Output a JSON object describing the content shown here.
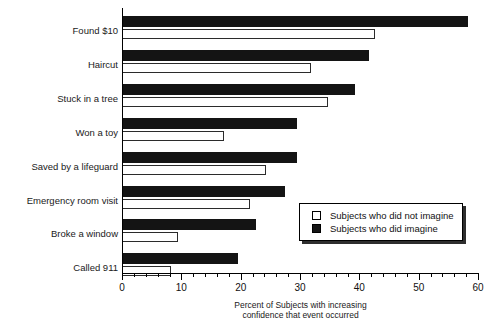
{
  "chart_data": {
    "type": "bar",
    "orientation": "horizontal",
    "title": "",
    "xlabel": "Percent of Subjects with increasing confidence that event occurred",
    "xlabel_line1": "Percent of Subjects with increasing",
    "xlabel_line2": "confidence that event occurred",
    "ylabel": "",
    "xlim": [
      0,
      60
    ],
    "xticks": [
      0,
      10,
      20,
      30,
      40,
      50,
      60
    ],
    "xtick_labels": [
      "0",
      "10",
      "20",
      "30",
      "40",
      "50",
      "60"
    ],
    "minor_tick_step": 2,
    "grid": false,
    "categories": [
      "Found $10",
      "Haircut",
      "Stuck in a tree",
      "Won a toy",
      "Saved by a lifeguard",
      "Emergency room visit",
      "Broke a window",
      "Called 911"
    ],
    "series": [
      {
        "name": "Subjects who did imagine",
        "color": "#141414",
        "values": [
          58.3,
          41.6,
          39.3,
          29.5,
          29.5,
          27.5,
          22.6,
          19.6
        ]
      },
      {
        "name": "Subjects who did not imagine",
        "color": "#ffffff",
        "values": [
          42.7,
          31.9,
          34.7,
          17.2,
          24.3,
          21.6,
          9.4,
          8.3
        ]
      }
    ],
    "legend": {
      "position": "inside-lower-right",
      "entries": [
        {
          "label": "Subjects who did not imagine",
          "swatch": "light"
        },
        {
          "label": "Subjects who did imagine",
          "swatch": "dark"
        }
      ]
    }
  }
}
